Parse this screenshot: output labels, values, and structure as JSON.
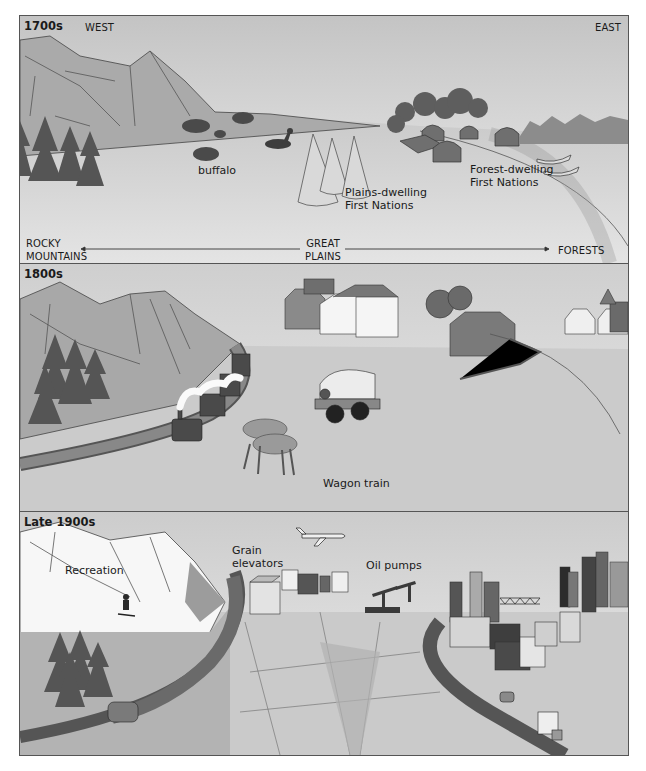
{
  "panels": [
    {
      "era": "1700s",
      "compass": {
        "west": "WEST",
        "east": "EAST"
      },
      "labels": {
        "buffalo": "buffalo",
        "plains_people": "Plains-dwelling\nFirst Nations",
        "forest_people": "Forest-dwelling\nFirst Nations"
      },
      "axis": {
        "left": "ROCKY\nMOUNTAINS",
        "center": "GREAT\nPLAINS",
        "right": "FORESTS"
      }
    },
    {
      "era": "1800s",
      "labels": {
        "wagon": "Wagon train"
      }
    },
    {
      "era": "Late 1900s",
      "labels": {
        "recreation": "Recreation",
        "grain": "Grain\nelevators",
        "oil": "Oil pumps"
      }
    }
  ],
  "colors": {
    "sky_top": "#c9c9c9",
    "sky_bottom": "#f2f2f2",
    "mountain": "#a9a9a9",
    "ground": "#cfcfcf",
    "tree": "#595959",
    "dark": "#3d3d3d",
    "border": "#555555"
  }
}
